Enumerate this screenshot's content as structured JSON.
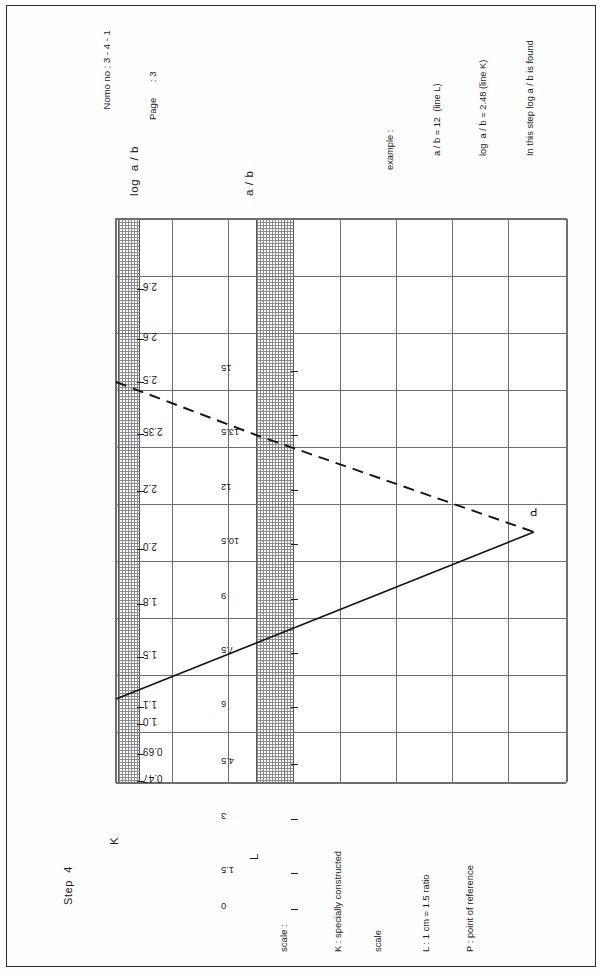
{
  "header": {
    "nomo_no": "Nomo no : 3 - 4 - 1",
    "page": "Page      : 3"
  },
  "example": {
    "line1": "example :",
    "line2": "a / b = 12  (line L)",
    "line3": "log  a / b = 2.48 (line K)",
    "line4": "In this step log a / b is found"
  },
  "captions": {
    "k_axis": "log  a / b",
    "l_axis": "a / b"
  },
  "step": {
    "label": "Step  4",
    "k_marker": "K",
    "l_marker": "L",
    "point_marker": "P"
  },
  "legend": {
    "title": "scale :",
    "items": [
      "K : specially constructed",
      "scale",
      "L : 1 cm = 1.5 ratio",
      "P : point of reference"
    ]
  },
  "chart_data": {
    "type": "line",
    "xlabel": "",
    "ylabel": "",
    "grid": true,
    "legend_position": "bottom-left",
    "axes": [
      {
        "name": "K",
        "label": "log  a / b",
        "orientation": "vertical-left",
        "tick_labels": [
          "2.6",
          "2.6",
          "2.5",
          "2.35",
          "2.2",
          "2.0",
          "1.8",
          "1.5",
          "1.1",
          "1.0",
          "0.69",
          "0.47"
        ],
        "tick_positions_px": [
          70,
          120,
          163,
          215,
          272,
          330,
          385,
          438,
          488,
          505,
          535,
          562
        ]
      },
      {
        "name": "L",
        "label": "a / b",
        "orientation": "vertical-left",
        "tick_labels": [
          "15",
          "13.5",
          "12",
          "10.5",
          "9",
          "7.5",
          "6",
          "4.5",
          "3",
          "1.5",
          "0"
        ],
        "tick_positions_px": [
          152,
          216,
          271,
          325,
          380,
          434,
          488,
          545,
          600,
          654,
          690
        ]
      }
    ],
    "series": [
      {
        "name": "line K (dashed) — log a/b = 2.48",
        "style": "dashed",
        "points": [
          [
            0,
            163
          ],
          [
            140,
            216
          ],
          [
            418,
            313
          ]
        ]
      },
      {
        "name": "line L (solid) — a / b = 12",
        "style": "solid",
        "points": [
          [
            0,
            480
          ],
          [
            418,
            313
          ]
        ]
      }
    ],
    "reference_point": {
      "label": "P",
      "x_px": 418,
      "y_px": 313
    },
    "bands": [
      {
        "name": "K",
        "x_px": 2,
        "width_px": 20
      },
      {
        "name": "L",
        "x_px": 140,
        "width_px": 36
      }
    ]
  }
}
